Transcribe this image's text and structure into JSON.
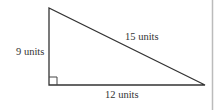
{
  "figure": {
    "type": "right-triangle",
    "labels": {
      "left_side": "9 units",
      "hypotenuse": "15 units",
      "bottom_side": "12 units"
    },
    "colors": {
      "stroke": "#333333",
      "border": "#bbbbbb",
      "background": "#ffffff"
    }
  }
}
